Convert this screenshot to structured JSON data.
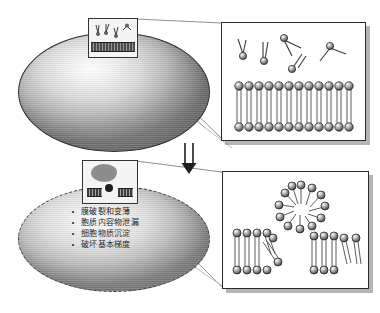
{
  "figure": {
    "title": "",
    "background_color": "#ffffff"
  },
  "cells": {
    "top": {
      "name": "intact-cell",
      "state_label": "",
      "outline_color": "#2b2b2b",
      "outline_style": "solid"
    },
    "bottom": {
      "name": "damaged-cell",
      "state_label": "",
      "outline_color": "#3a3a3a",
      "outline_style": "dashed"
    }
  },
  "damage_effects": {
    "bullet_marker": "•",
    "items": [
      "膜破裂和变薄",
      "胞质内容物泄漏",
      "细胞物质沉淀",
      "破坏基本梯度"
    ]
  },
  "insets": {
    "top": {
      "caption": "",
      "description": "intact-membrane-region"
    },
    "bottom": {
      "caption": "",
      "description": "ruptured-membrane-region"
    }
  },
  "panels": {
    "top": {
      "caption": "",
      "description": "intact-lipid-bilayer-with-free-phospholipids",
      "bilayer_head_count": 12,
      "free_lipid_count": 5
    },
    "bottom": {
      "caption": "",
      "description": "disrupted-membrane-micelle-and-fragments",
      "micelle_count": 1,
      "fragment_count": 2
    }
  },
  "arrow": {
    "label": "",
    "direction": "down",
    "style": "double-line"
  },
  "colors": {
    "lipid_head": "#9c9c9c",
    "lipid_head_dark": "#3a3a3a",
    "lipid_tail": "#555555",
    "panel_border": "#2a2a2a",
    "panel_shadow": "#787878",
    "leader_line": "#9a9a9a"
  }
}
